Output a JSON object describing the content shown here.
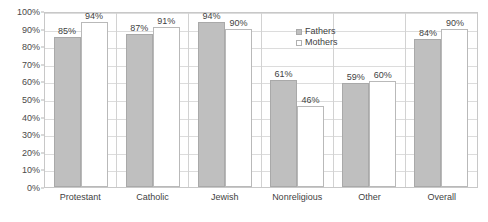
{
  "chart_data": {
    "type": "bar",
    "title": "",
    "subtitle": "",
    "xlabel": "",
    "ylabel": "",
    "ylim": [
      0,
      100
    ],
    "ytick_labels": [
      "100%",
      "90%",
      "80%",
      "70%",
      "60%",
      "50%",
      "40%",
      "30%",
      "20%",
      "10%",
      "0%"
    ],
    "ytick_values": [
      100,
      90,
      80,
      70,
      60,
      50,
      40,
      30,
      20,
      10,
      0
    ],
    "grid": true,
    "legend_position": "top-right-inside",
    "categories": [
      "Protestant",
      "Catholic",
      "Jewish",
      "Nonreligious",
      "Other",
      "Overall"
    ],
    "series": [
      {
        "name": "Fathers",
        "color": "#bfbfbf",
        "values": [
          85,
          87,
          94,
          61,
          59,
          84
        ],
        "labels": [
          "85%",
          "87%",
          "94%",
          "61%",
          "59%",
          "84%"
        ]
      },
      {
        "name": "Mothers",
        "color": "#ffffff",
        "values": [
          94,
          91,
          90,
          46,
          60,
          90
        ],
        "labels": [
          "94%",
          "91%",
          "90%",
          "46%",
          "60%",
          "90%"
        ]
      }
    ]
  },
  "legend": {
    "items": [
      {
        "label": "Fathers"
      },
      {
        "label": "Mothers"
      }
    ]
  }
}
